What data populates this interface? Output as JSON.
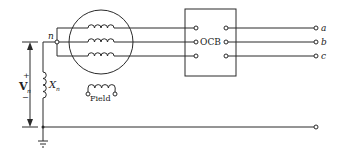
{
  "diagram": {
    "type": "circuit-schematic",
    "labels": {
      "neutral_node": "n",
      "breaker": "OCB",
      "field": "Field",
      "neutral_reactance": "X",
      "neutral_reactance_sub": "n",
      "voltage": "V",
      "voltage_sub": "n",
      "voltage_plus": "+",
      "voltage_minus": "−",
      "terminal_a": "a",
      "terminal_b": "b",
      "terminal_c": "c"
    },
    "components": [
      {
        "id": "generator",
        "kind": "synchronous machine (circle) with 3 wye-connected armature windings"
      },
      {
        "id": "field-winding",
        "kind": "inductor with two terminals",
        "label": "Field"
      },
      {
        "id": "neutral-reactor",
        "kind": "inductor",
        "label": "Xn"
      },
      {
        "id": "ocb",
        "kind": "oil circuit breaker box",
        "label": "OCB"
      },
      {
        "id": "ground",
        "kind": "ground symbol"
      },
      {
        "id": "voltage-arrow",
        "kind": "voltage indicator",
        "label": "Vn"
      }
    ],
    "terminals": [
      "a",
      "b",
      "c",
      "ground-return"
    ],
    "colors": {
      "line": "#2a2a2a",
      "background": "#ffffff"
    }
  }
}
